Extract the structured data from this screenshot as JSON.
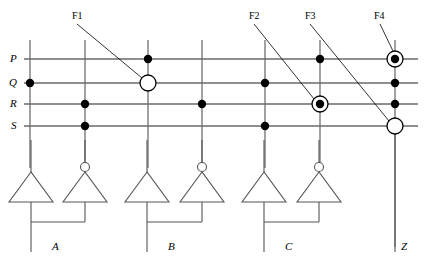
{
  "diagram": {
    "stroke_color": "#555555",
    "bus_color": "#6a6a6a",
    "node_color": "#000000",
    "text_color": "#000000",
    "width": 424,
    "height": 263
  },
  "bus_labels": [
    {
      "name": "bus-label-p",
      "text": "P",
      "x": 10,
      "y": 53
    },
    {
      "name": "bus-label-q",
      "text": "Q",
      "x": 9,
      "y": 77
    },
    {
      "name": "bus-label-r",
      "text": "R",
      "x": 10,
      "y": 98
    },
    {
      "name": "bus-label-s",
      "text": "S",
      "x": 11,
      "y": 120
    }
  ],
  "buses": [
    {
      "id": "P",
      "y": 59,
      "x1": 24,
      "x2": 418
    },
    {
      "id": "Q",
      "y": 83,
      "x1": 24,
      "x2": 418
    },
    {
      "id": "R",
      "y": 104,
      "x1": 24,
      "x2": 418
    },
    {
      "id": "S",
      "y": 126,
      "x1": 24,
      "x2": 418
    }
  ],
  "columns": [
    {
      "id": "col-1",
      "x": 30,
      "y1": 40,
      "y2": 168
    },
    {
      "id": "col-2",
      "x": 85,
      "y1": 40,
      "y2": 168
    },
    {
      "id": "col-3",
      "x": 148,
      "y1": 40,
      "y2": 168
    },
    {
      "id": "col-4",
      "x": 202,
      "y1": 40,
      "y2": 168
    },
    {
      "id": "col-5",
      "x": 265,
      "y1": 40,
      "y2": 168
    },
    {
      "id": "col-6",
      "x": 320,
      "y1": 40,
      "y2": 168
    },
    {
      "id": "col-7",
      "x": 395,
      "y1": 40,
      "y2": 247
    }
  ],
  "nodes": [
    {
      "name": "node-q-col1",
      "x": 30,
      "y": 83,
      "type": "dot",
      "r": 4.2
    },
    {
      "name": "node-r-col2",
      "x": 85,
      "y": 104,
      "type": "dot",
      "r": 4.2
    },
    {
      "name": "node-s-col2",
      "x": 85,
      "y": 126,
      "type": "dot",
      "r": 4.2
    },
    {
      "name": "node-p-col3",
      "x": 148,
      "y": 59,
      "type": "dot",
      "r": 4.2
    },
    {
      "name": "node-q-col3",
      "x": 148,
      "y": 83,
      "type": "open-circle",
      "r": 8.0
    },
    {
      "name": "node-r-col4",
      "x": 202,
      "y": 104,
      "type": "dot",
      "r": 4.2
    },
    {
      "name": "node-q-col5",
      "x": 265,
      "y": 83,
      "type": "dot",
      "r": 4.2
    },
    {
      "name": "node-s-col5",
      "x": 265,
      "y": 126,
      "type": "dot",
      "r": 4.2
    },
    {
      "name": "node-p-col6",
      "x": 320,
      "y": 59,
      "type": "dot",
      "r": 4.2
    },
    {
      "name": "node-r-col6",
      "x": 320,
      "y": 104,
      "type": "circled-dot",
      "r": 4.2,
      "ring": 8.0
    },
    {
      "name": "node-p-col7",
      "x": 395,
      "y": 59,
      "type": "circled-dot",
      "r": 4.2,
      "ring": 8.0
    },
    {
      "name": "node-q-col7",
      "x": 395,
      "y": 83,
      "type": "dot",
      "r": 4.2
    },
    {
      "name": "node-r-col7",
      "x": 395,
      "y": 104,
      "type": "dot",
      "r": 4.2
    },
    {
      "name": "node-s-col7",
      "x": 395,
      "y": 126,
      "type": "open-circle",
      "r": 8.0
    }
  ],
  "callouts": [
    {
      "name": "callout-f1",
      "label": "F1",
      "label_x": 72,
      "label_y": 11,
      "line": {
        "x1": 77,
        "y1": 24,
        "x2": 142,
        "y2": 78
      }
    },
    {
      "name": "callout-f2",
      "label": "F2",
      "label_x": 249,
      "label_y": 11,
      "line": {
        "x1": 254,
        "y1": 24,
        "x2": 314,
        "y2": 99
      }
    },
    {
      "name": "callout-f3",
      "label": "F3",
      "label_x": 305,
      "label_y": 11,
      "line": {
        "x1": 310,
        "y1": 24,
        "x2": 389,
        "y2": 121
      }
    },
    {
      "name": "callout-f4",
      "label": "F4",
      "label_x": 374,
      "label_y": 11,
      "line": {
        "x1": 380,
        "y1": 24,
        "x2": 393,
        "y2": 51
      }
    }
  ],
  "gates": [
    {
      "name": "gate-1",
      "kind": "buffer",
      "cx": 31,
      "stem_top": 140
    },
    {
      "name": "gate-2",
      "kind": "inverter",
      "cx": 85,
      "stem_top": 140
    },
    {
      "name": "gate-3",
      "kind": "buffer",
      "cx": 147,
      "stem_top": 140
    },
    {
      "name": "gate-4",
      "kind": "inverter",
      "cx": 202,
      "stem_top": 140
    },
    {
      "name": "gate-5",
      "kind": "buffer",
      "cx": 264,
      "stem_top": 140
    },
    {
      "name": "gate-6",
      "kind": "inverter",
      "cx": 319,
      "stem_top": 140
    }
  ],
  "gate_geometry": {
    "apex_y": 172,
    "base_y": 202,
    "half_width": 22,
    "bubble_r": 4.5,
    "bubble_cy": 167
  },
  "output_groups": [
    {
      "name": "output-group-a",
      "label": "A",
      "label_x": 52,
      "label_y": 248,
      "left_x": 31,
      "right_x": 85,
      "drop_y": 222,
      "tap_x": 31,
      "bottom_y": 252
    },
    {
      "name": "output-group-b",
      "label": "B",
      "label_x": 168,
      "label_y": 248,
      "left_x": 147,
      "right_x": 202,
      "drop_y": 222,
      "tap_x": 147,
      "bottom_y": 252
    },
    {
      "name": "output-group-c",
      "label": "C",
      "label_x": 285,
      "label_y": 248,
      "left_x": 264,
      "right_x": 319,
      "drop_y": 222,
      "tap_x": 264,
      "bottom_y": 252
    }
  ],
  "output_z": {
    "name": "output-z",
    "label": "Z",
    "label_x": 401,
    "label_y": 248,
    "x": 395,
    "y1": 126,
    "y2": 252
  }
}
